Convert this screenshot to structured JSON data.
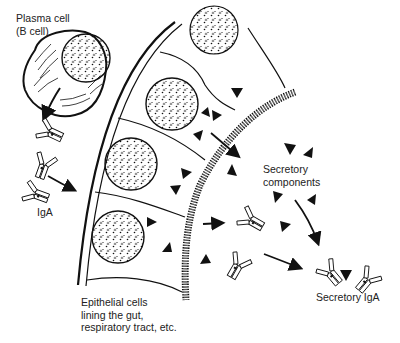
{
  "diagram": {
    "labels": {
      "plasma_cell_line1": "Plasma cell",
      "plasma_cell_line2": "(B cell)",
      "iga": "IgA",
      "secretory_components_line1": "Secretory",
      "secretory_components_line2": "components",
      "secretory_iga": "Secretory IgA",
      "epithelial_line1": "Epithelial cells",
      "epithelial_line2": "lining the gut,",
      "epithelial_line3": "respiratory tract, etc."
    },
    "colors": {
      "ink": "#111111",
      "background": "#ffffff"
    }
  }
}
